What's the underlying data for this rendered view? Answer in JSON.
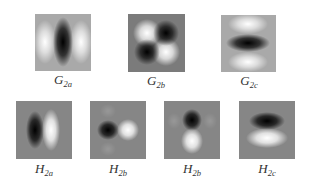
{
  "figure": {
    "rows": [
      {
        "name": "G",
        "panels": [
          {
            "id": "G2a",
            "base": "G",
            "sub": "2a",
            "pattern": "vertical-dark-center-bright-sides",
            "background": "#a9a9a9"
          },
          {
            "id": "G2b",
            "base": "G",
            "sub": "2b",
            "pattern": "diagonal-quadrant-checker",
            "background": "#7b7b7b"
          },
          {
            "id": "G2c",
            "base": "G",
            "sub": "2c",
            "pattern": "horizontal-dark-center-bright-top-bottom",
            "background": "#a9a9a9"
          }
        ]
      },
      {
        "name": "H",
        "panels": [
          {
            "id": "H2a",
            "base": "H",
            "sub": "2a",
            "pattern": "dark-left-bright-right",
            "background": "#868686"
          },
          {
            "id": "H2b_1",
            "base": "H",
            "sub": "2b",
            "pattern": "dark-left-bright-right-round",
            "background": "#868686"
          },
          {
            "id": "H2b_2",
            "base": "H",
            "sub": "2b",
            "pattern": "dark-top-bright-bottom",
            "background": "#868686"
          },
          {
            "id": "H2c",
            "base": "H",
            "sub": "2c",
            "pattern": "dark-top-bright-bottom-wide",
            "background": "#868686"
          }
        ]
      }
    ]
  }
}
